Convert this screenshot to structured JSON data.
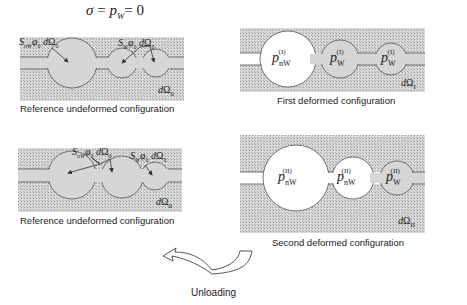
{
  "title_equation": "σ = p_W = 0",
  "panels": [
    {
      "id": "ref-top",
      "caption": "Reference undeformed configuration",
      "domain_label": "dΩ0",
      "annotations": [
        "S_nW φ0 dΩ0",
        "S_W φ0 dΩ0"
      ]
    },
    {
      "id": "first-deformed",
      "caption": "First deformed configuration",
      "domain_label": "dΩI",
      "pores": [
        "p_nW^(I)",
        "p_W^(I)",
        "p_W^(I)"
      ]
    },
    {
      "id": "ref-bottom",
      "caption": "Reference undeformed configuration",
      "domain_label": "dΩ0",
      "annotations": [
        "S_nW φ0 dΩ0",
        "S_W φ0 dΩ0"
      ]
    },
    {
      "id": "second-deformed",
      "caption": "Second deformed configuration",
      "domain_label": "dΩII",
      "pores": [
        "p_nW^(II)",
        "p_nW^(II)",
        "p_W^(II)"
      ]
    }
  ],
  "arrow_label": "Unloading",
  "text": {
    "sigma": "σ",
    "eq": " = ",
    "p": "p",
    "W": "W",
    "nW": "nW",
    "zero": "= 0",
    "S": "S",
    "phi0": "φ",
    "d": "d",
    "Omega": "Ω",
    "sub0": "0",
    "subI": "I",
    "subII": "II",
    "supI": "(I)",
    "supII": "(II)",
    "caption_ref": "Reference undeformed configuration",
    "caption_first": "First deformed configuration",
    "caption_second": "Second deformed configuration",
    "unloading": "Unloading"
  },
  "colors": {
    "matrix_hatch": "#cfcfcf",
    "wetting_fluid": "#d6d6d6",
    "nonwetting_fluid": "#ffffff",
    "outline": "#555555"
  }
}
